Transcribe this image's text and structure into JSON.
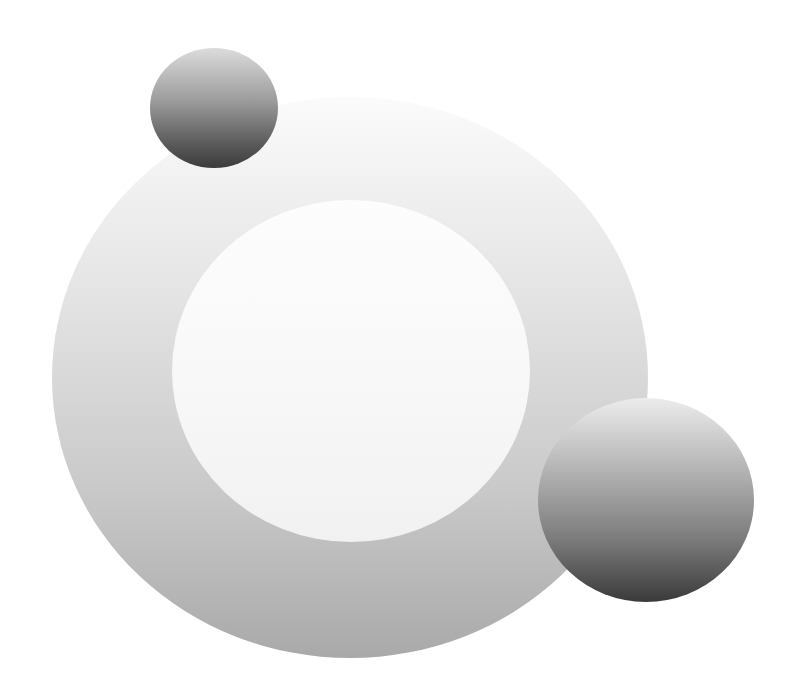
{
  "illustration": {
    "description": "Abstract composition: large grey ring with two shaded spheres",
    "background_color": "#ffffff",
    "shapes": [
      {
        "name": "outer-ring",
        "type": "ring",
        "center": [
          350,
          377
        ],
        "outer_radius_x": 298,
        "outer_radius_y": 280,
        "gradient": [
          "#fbfbfb",
          "#e4e4e4",
          "#c9c9c9",
          "#a9a9a9"
        ]
      },
      {
        "name": "ring-hole",
        "type": "circle",
        "center": [
          351,
          371
        ],
        "radius_x": 179,
        "radius_y": 171,
        "color": "#f7f7f7"
      },
      {
        "name": "small-sphere",
        "type": "sphere",
        "center": [
          214,
          108
        ],
        "radius": 62,
        "gradient": [
          "#dcdcdc",
          "#9a9a9a",
          "#5a5a5a",
          "#3c3c3c"
        ]
      },
      {
        "name": "large-sphere",
        "type": "sphere",
        "center": [
          646,
          500
        ],
        "radius": 105,
        "gradient": [
          "#ececec",
          "#b4b4b4",
          "#7a7a7a",
          "#3a3a3a"
        ]
      }
    ]
  }
}
